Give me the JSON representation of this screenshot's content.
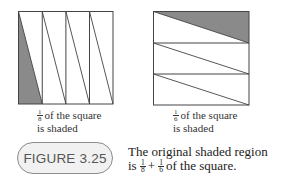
{
  "figures": [
    {
      "id": "left",
      "division": "vertical",
      "strips": 4,
      "shaded_fraction": {
        "num": "1",
        "den": "8"
      },
      "caption_rest_line1": "of the square",
      "caption_line2": "is shaded"
    },
    {
      "id": "right",
      "division": "horizontal",
      "strips": 3,
      "shaded_fraction": {
        "num": "1",
        "den": "6"
      },
      "caption_rest_line1": "of the square",
      "caption_line2": "is shaded"
    }
  ],
  "figure_label": "FIGURE 3.25",
  "description": {
    "line1": "The original shaded region",
    "line2_prefix": "is",
    "frac1": {
      "num": "1",
      "den": "8"
    },
    "plus": "+",
    "frac2": {
      "num": "1",
      "den": "6"
    },
    "line2_suffix": "of the square."
  },
  "colors": {
    "shade": "#8a8a8a",
    "line": "#444444",
    "pill_fill": "#f1f1f1",
    "pill_border": "#8c8c8c"
  }
}
